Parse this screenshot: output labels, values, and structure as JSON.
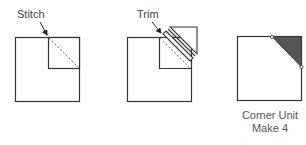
{
  "steps": [
    {
      "id": "stitch",
      "label": "Stitch"
    },
    {
      "id": "trim",
      "label": "Trim"
    },
    {
      "id": "result",
      "caption_line1": "Corner Unit",
      "caption_line2": "Make 4"
    }
  ],
  "colors": {
    "outline": "#333333",
    "fill_triangle": "#555555",
    "seam": "#777777"
  }
}
